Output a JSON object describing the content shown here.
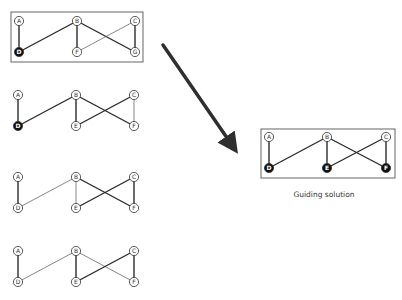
{
  "colors": {
    "stroke": "#2b2b2b",
    "thin_stroke": "#555555",
    "filled_node": "#111111",
    "empty_node": "#ffffff",
    "arrow": "#2f2f2f",
    "box": "#555555"
  },
  "arrow": {
    "from": [
      163,
      45
    ],
    "to": [
      234,
      148
    ]
  },
  "graphs": [
    {
      "id": "graph-1",
      "boxed": true,
      "box": [
        11,
        12,
        132,
        50
      ],
      "nodes": [
        {
          "label": "A",
          "x": 19,
          "y": 21,
          "filled": false
        },
        {
          "label": "B",
          "x": 77,
          "y": 21,
          "filled": false
        },
        {
          "label": "C",
          "x": 135,
          "y": 21,
          "filled": false
        },
        {
          "label": "D",
          "x": 19,
          "y": 52,
          "filled": true
        },
        {
          "label": "F",
          "x": 77,
          "y": 52,
          "filled": false
        },
        {
          "label": "G",
          "x": 135,
          "y": 52,
          "filled": false
        }
      ],
      "edges": [
        {
          "from": "A",
          "to": "D",
          "thick": true
        },
        {
          "from": "D",
          "to": "B",
          "thick": true
        },
        {
          "from": "B",
          "to": "F",
          "thick": true
        },
        {
          "from": "B",
          "to": "G",
          "thick": true
        },
        {
          "from": "C",
          "to": "F",
          "thick": false
        },
        {
          "from": "C",
          "to": "G",
          "thick": true
        }
      ]
    },
    {
      "id": "graph-2",
      "boxed": false,
      "nodes": [
        {
          "label": "A",
          "x": 18,
          "y": 95,
          "filled": false
        },
        {
          "label": "B",
          "x": 76,
          "y": 95,
          "filled": false
        },
        {
          "label": "C",
          "x": 134,
          "y": 95,
          "filled": false
        },
        {
          "label": "D",
          "x": 18,
          "y": 126,
          "filled": true
        },
        {
          "label": "E",
          "x": 76,
          "y": 126,
          "filled": false
        },
        {
          "label": "F",
          "x": 134,
          "y": 126,
          "filled": false
        }
      ],
      "edges": [
        {
          "from": "A",
          "to": "D",
          "thick": true
        },
        {
          "from": "D",
          "to": "B",
          "thick": true
        },
        {
          "from": "B",
          "to": "E",
          "thick": true
        },
        {
          "from": "B",
          "to": "F",
          "thick": true
        },
        {
          "from": "C",
          "to": "E",
          "thick": true
        },
        {
          "from": "C",
          "to": "F",
          "thick": false
        }
      ]
    },
    {
      "id": "graph-3",
      "boxed": false,
      "nodes": [
        {
          "label": "A",
          "x": 18,
          "y": 177,
          "filled": false
        },
        {
          "label": "B",
          "x": 76,
          "y": 177,
          "filled": false
        },
        {
          "label": "C",
          "x": 134,
          "y": 177,
          "filled": false
        },
        {
          "label": "D",
          "x": 18,
          "y": 208,
          "filled": false
        },
        {
          "label": "E",
          "x": 76,
          "y": 208,
          "filled": false
        },
        {
          "label": "F",
          "x": 134,
          "y": 208,
          "filled": false
        }
      ],
      "edges": [
        {
          "from": "A",
          "to": "D",
          "thick": true
        },
        {
          "from": "D",
          "to": "B",
          "thick": false
        },
        {
          "from": "B",
          "to": "E",
          "thick": false
        },
        {
          "from": "B",
          "to": "F",
          "thick": true
        },
        {
          "from": "C",
          "to": "E",
          "thick": true
        },
        {
          "from": "C",
          "to": "F",
          "thick": true
        }
      ]
    },
    {
      "id": "graph-4",
      "boxed": false,
      "nodes": [
        {
          "label": "A",
          "x": 18,
          "y": 251,
          "filled": false
        },
        {
          "label": "B",
          "x": 76,
          "y": 251,
          "filled": false
        },
        {
          "label": "C",
          "x": 134,
          "y": 251,
          "filled": false
        },
        {
          "label": "D",
          "x": 18,
          "y": 282,
          "filled": false
        },
        {
          "label": "E",
          "x": 76,
          "y": 282,
          "filled": false
        },
        {
          "label": "F",
          "x": 134,
          "y": 282,
          "filled": false
        }
      ],
      "edges": [
        {
          "from": "A",
          "to": "D",
          "thick": true
        },
        {
          "from": "D",
          "to": "B",
          "thick": false
        },
        {
          "from": "B",
          "to": "E",
          "thick": true
        },
        {
          "from": "B",
          "to": "F",
          "thick": false
        },
        {
          "from": "C",
          "to": "E",
          "thick": true
        },
        {
          "from": "C",
          "to": "F",
          "thick": true
        }
      ]
    },
    {
      "id": "guiding-solution",
      "boxed": true,
      "box": [
        261,
        129,
        134,
        49
      ],
      "nodes": [
        {
          "label": "A",
          "x": 269,
          "y": 137,
          "filled": false
        },
        {
          "label": "B",
          "x": 327,
          "y": 137,
          "filled": false
        },
        {
          "label": "C",
          "x": 386,
          "y": 137,
          "filled": false
        },
        {
          "label": "D",
          "x": 269,
          "y": 168,
          "filled": true
        },
        {
          "label": "E",
          "x": 327,
          "y": 168,
          "filled": true
        },
        {
          "label": "F",
          "x": 386,
          "y": 168,
          "filled": true
        }
      ],
      "edges": [
        {
          "from": "A",
          "to": "D",
          "thick": true
        },
        {
          "from": "D",
          "to": "B",
          "thick": true
        },
        {
          "from": "B",
          "to": "E",
          "thick": true
        },
        {
          "from": "B",
          "to": "F",
          "thick": true
        },
        {
          "from": "C",
          "to": "E",
          "thick": true
        },
        {
          "from": "C",
          "to": "F",
          "thick": true
        }
      ]
    }
  ],
  "guiding_caption": {
    "text": "Guiding solution",
    "x": 264,
    "y": 190
  }
}
